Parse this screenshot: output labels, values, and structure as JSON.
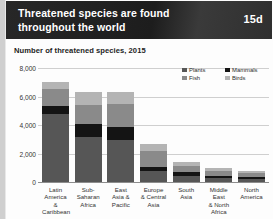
{
  "header": {
    "title": "Threatened species are found throughout the world",
    "badge": "15d"
  },
  "subtitle": "Number of threatened species, 2015",
  "legend": [
    {
      "label": "Plants",
      "color": "#565656",
      "icon": "square-swatch-icon"
    },
    {
      "label": "Mammals",
      "color": "#141414",
      "icon": "square-swatch-icon"
    },
    {
      "label": "Fish",
      "color": "#8a8a8a",
      "icon": "square-swatch-icon"
    },
    {
      "label": "Birds",
      "color": "#b4b4b4",
      "icon": "square-swatch-icon"
    }
  ],
  "yticks": [
    "8,000",
    "6,000",
    "4,000",
    "2,000",
    "0"
  ],
  "xlabels": [
    "Latin\nAmerica &\nCaribbean",
    "Sub-\nSaharan\nAfrica",
    "East\nAsia &\nPacific",
    "Europe\n& Central\nAsia",
    "South\nAsia",
    "Middle East\n& North\nAfrica",
    "North\nAmerica"
  ],
  "chart_data": {
    "type": "bar",
    "subtype": "stacked-vertical-bar",
    "title": "Threatened species are found throughout the world",
    "subtitle": "Number of threatened species, 2015",
    "xlabel": "",
    "ylabel": "",
    "ylim": [
      0,
      8000
    ],
    "yticks": [
      0,
      2000,
      4000,
      6000,
      8000
    ],
    "grid": true,
    "legend_position": "top-right",
    "categories": [
      "Latin America & Caribbean",
      "Sub-Saharan Africa",
      "East Asia & Pacific",
      "Europe & Central Asia",
      "South Asia",
      "Middle East & North Africa",
      "North America"
    ],
    "series": [
      {
        "name": "Plants",
        "color": "#565656",
        "values": [
          4750,
          3150,
          2950,
          800,
          450,
          250,
          200
        ]
      },
      {
        "name": "Mammals",
        "color": "#141414",
        "values": [
          600,
          900,
          900,
          250,
          250,
          150,
          150
        ]
      },
      {
        "name": "Fish",
        "color": "#8a8a8a",
        "values": [
          1150,
          1350,
          1650,
          1100,
          450,
          350,
          300
        ]
      },
      {
        "name": "Birds",
        "color": "#b4b4b4",
        "values": [
          500,
          950,
          850,
          550,
          250,
          200,
          100
        ]
      }
    ],
    "totals": [
      7000,
      6350,
      6350,
      2700,
      1400,
      950,
      750
    ]
  }
}
